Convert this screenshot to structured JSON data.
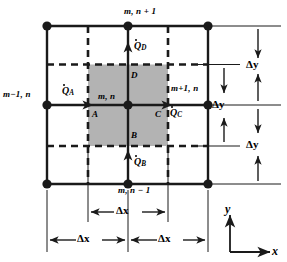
{
  "figure": {
    "shaded_color": "#b3b3b3",
    "line_color": "#1a1a1a"
  },
  "nodes": {
    "top_center": "m, n + 1",
    "left_center": "m−1, n",
    "right_center": "m+1, n",
    "bottom_center": "m, n − 1",
    "center": "m, n"
  },
  "corners": {
    "a": "A",
    "b": "B",
    "c": "C",
    "d": "D"
  },
  "fluxes": {
    "qa": {
      "symbol": "Q",
      "sub": "A"
    },
    "qb": {
      "symbol": "Q",
      "sub": "B"
    },
    "qc": {
      "symbol": "Q",
      "sub": "C"
    },
    "qd": {
      "symbol": "Q",
      "sub": "D"
    }
  },
  "dimensions": {
    "dy_top": "Δy",
    "dy_mid": "Δy",
    "dy_bottom": "Δy",
    "dx_cv": "Δx",
    "dx_left": "Δx",
    "dx_right": "Δx"
  },
  "axes": {
    "x": "x",
    "y": "y"
  }
}
